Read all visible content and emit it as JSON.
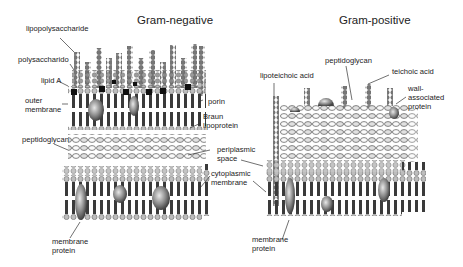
{
  "panels": {
    "gram_negative": {
      "title": "Gram-negative",
      "labels": {
        "lipopolysaccharide": "lipopolysaccharide",
        "polysaccharide": "polysaccharido",
        "lipid_a": "lipid A",
        "outer_membrane_1": "outer",
        "outer_membrane_2": "membrane",
        "porin": "porin",
        "braun_1": "Braun",
        "braun_2": "lipoprotein",
        "peptidoglycan": "peptidoglycan",
        "periplasmic_1": "periplasmic",
        "periplasmic_2": "space",
        "cytoplasmic_1": "cytoplasmic",
        "cytoplasmic_2": "membrane",
        "membrane_protein_1": "membrane",
        "membrane_protein_2": "protein"
      }
    },
    "gram_positive": {
      "title": "Gram-positive",
      "labels": {
        "lipoteichoic_acid": "lipoteichoic acid",
        "peptidoglycan": "peptidoglycan",
        "teichoic_acid": "teichoic acid",
        "wall_protein_1": "wall-",
        "wall_protein_2": "associated",
        "wall_protein_3": "protein",
        "membrane_protein_1": "membrane",
        "membrane_protein_2": "protein"
      }
    }
  },
  "colors": {
    "lipid_head": "#9a9a9a",
    "lipid_tail": "#3c3c3c",
    "lps_bead": "#7a7a7a",
    "lipid_a_block": "#111111",
    "protein": "#8a8a8a",
    "leader": "#333333"
  }
}
